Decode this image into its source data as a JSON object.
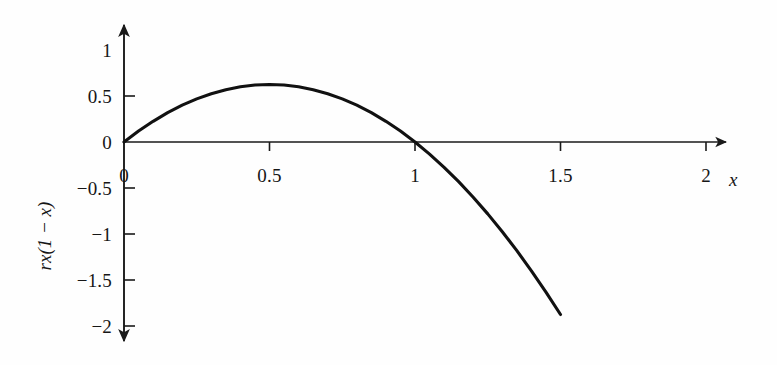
{
  "chart_data": {
    "type": "line",
    "title": "",
    "subtitle": "",
    "xlabel": "x",
    "ylabel": "rx(1 − x)",
    "formula": "rx(1 − x)",
    "r_value": 2.5,
    "xlim": [
      0,
      2.15
    ],
    "ylim": [
      -2.2,
      1.15
    ],
    "grid": false,
    "legend": null,
    "x_ticks": [
      {
        "value": 0,
        "label": "0"
      },
      {
        "value": 0.5,
        "label": "0.5"
      },
      {
        "value": 1,
        "label": "1"
      },
      {
        "value": 1.5,
        "label": "1.5"
      },
      {
        "value": 2,
        "label": "2"
      }
    ],
    "y_ticks": [
      {
        "value": 1,
        "label": "1"
      },
      {
        "value": 0.5,
        "label": "0.5"
      },
      {
        "value": 0,
        "label": "0"
      },
      {
        "value": -0.5,
        "label": "−0.5"
      },
      {
        "value": -1,
        "label": "−1"
      },
      {
        "value": -1.5,
        "label": "−1.5"
      },
      {
        "value": -2,
        "label": "−2"
      }
    ],
    "series": [
      {
        "name": "rx(1 − x)",
        "color": "#111111",
        "x": [
          0,
          0.05,
          0.1,
          0.15,
          0.2,
          0.25,
          0.3,
          0.35,
          0.4,
          0.45,
          0.5,
          0.55,
          0.6,
          0.65,
          0.7,
          0.75,
          0.8,
          0.85,
          0.9,
          0.95,
          1,
          1.05,
          1.1,
          1.15,
          1.2,
          1.25,
          1.3,
          1.35,
          1.4,
          1.45,
          1.5
        ],
        "y": [
          0,
          0.11875,
          0.225,
          0.31875,
          0.4,
          0.46875,
          0.525,
          0.56875,
          0.6,
          0.61875,
          0.625,
          0.61875,
          0.6,
          0.56875,
          0.525,
          0.46875,
          0.4,
          0.31875,
          0.225,
          0.11875,
          0,
          -0.13125,
          -0.275,
          -0.43125,
          -0.6,
          -0.78125,
          -0.975,
          -1.18125,
          -1.4,
          -1.63125,
          -1.875
        ]
      }
    ],
    "axis_style": {
      "x_axis_arrow": true,
      "y_axis_arrow_up": true,
      "y_axis_arrow_down": true,
      "line_color": "#1a1a1a",
      "curve_color": "#111111"
    }
  },
  "figure": {
    "background_color": "#fefefe"
  }
}
